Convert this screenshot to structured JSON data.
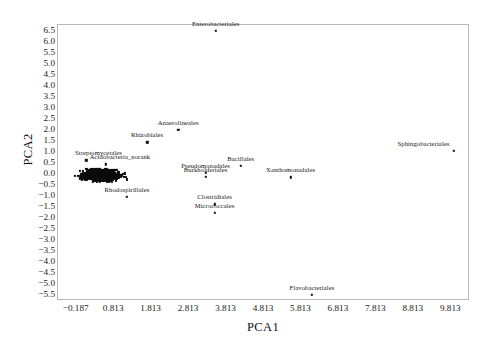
{
  "chart_data": {
    "type": "scatter",
    "title": "",
    "xlabel": "PCA1",
    "ylabel": "PCA2",
    "xlim": [
      -0.687,
      10.313
    ],
    "ylim": [
      -5.75,
      6.75
    ],
    "grid": false,
    "legend": "none",
    "xticks": [
      "-0.187",
      "0.813",
      "1.813",
      "2.813",
      "3.813",
      "4.813",
      "5.813",
      "6.813",
      "7.813",
      "8.813",
      "9.813"
    ],
    "xtick_values": [
      -0.187,
      0.813,
      1.813,
      2.813,
      3.813,
      4.813,
      5.813,
      6.813,
      7.813,
      8.813,
      9.813
    ],
    "yticks": [
      "6.5",
      "6.0",
      "5.5",
      "5.0",
      "4.5",
      "4.0",
      "3.5",
      "3.0",
      "2.5",
      "2.0",
      "1.5",
      "1.0",
      "0.5",
      "0.0",
      "-0.5",
      "-1.0",
      "-1.5",
      "-2.0",
      "-2.5",
      "-3.0",
      "-3.5",
      "-4.0",
      "-4.5",
      "-5.0",
      "-5.5"
    ],
    "ytick_values": [
      6.5,
      6.0,
      5.5,
      5.0,
      4.5,
      4.0,
      3.5,
      3.0,
      2.5,
      2.0,
      1.5,
      1.0,
      0.5,
      0.0,
      -0.5,
      -1.0,
      -1.5,
      -2.0,
      -2.5,
      -3.0,
      -3.5,
      -4.0,
      -4.5,
      -5.0,
      -5.5
    ],
    "labeled_points": [
      {
        "label": "Enterobacteriales",
        "x": 3.55,
        "y": 6.45,
        "label_dx": 0,
        "label_dy": -4
      },
      {
        "label": "Sphingobacteriales",
        "x": 9.9,
        "y": 1.02,
        "label_dx": -30,
        "label_dy": -4
      },
      {
        "label": "Anaerolineales",
        "x": 2.55,
        "y": 1.95,
        "label_dx": 0,
        "label_dy": -4
      },
      {
        "label": "Rhizobiales",
        "x": 1.72,
        "y": 1.4,
        "label_dx": 0,
        "label_dy": -4
      },
      {
        "label": "Bacillales",
        "x": 4.22,
        "y": 0.33,
        "label_dx": 0,
        "label_dy": -4
      },
      {
        "label": "Pseudomonadales",
        "x": 3.28,
        "y": 0.02,
        "label_dx": 0,
        "label_dy": -4
      },
      {
        "label": "Burkholderiales",
        "x": 3.28,
        "y": -0.18,
        "label_dx": 0,
        "label_dy": -4
      },
      {
        "label": "Xanthomonadales",
        "x": 5.55,
        "y": -0.2,
        "label_dx": 0,
        "label_dy": -4
      },
      {
        "label": "Clostridiales",
        "x": 3.52,
        "y": -1.42,
        "label_dx": 0,
        "label_dy": -4
      },
      {
        "label": "Micrococcales",
        "x": 3.52,
        "y": -1.8,
        "label_dx": 0,
        "label_dy": -4
      },
      {
        "label": "Rhodospirillales",
        "x": 1.18,
        "y": -1.08,
        "label_dx": 0,
        "label_dy": -4
      },
      {
        "label": "Flavobacteriales",
        "x": 6.12,
        "y": -5.52,
        "label_dx": 0,
        "label_dy": -4
      },
      {
        "label": "Streptomycetales",
        "x": 0.1,
        "y": 0.58,
        "label_dx": 12,
        "label_dy": -4
      },
      {
        "label": "Acidobacteria_norank",
        "x": 0.62,
        "y": 0.4,
        "label_dx": 14,
        "label_dy": -4
      }
    ],
    "cluster": {
      "description": "dense unlabeled point cloud near origin",
      "x_range": [
        -0.62,
        1.55
      ],
      "y_range": [
        -0.62,
        0.52
      ],
      "approx_count": 900
    }
  }
}
